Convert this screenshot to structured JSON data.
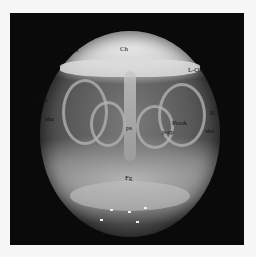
{
  "figure": {
    "labels": {
      "ch": "Ch",
      "r_on": "R-ON",
      "l_on": "L-ON",
      "ica_left": "ICA",
      "ica_right": "ICA",
      "sha_left": "sha",
      "sha_right": "sha",
      "ps": "ps",
      "pcp": "p-cp",
      "pcom": "PcoA",
      "fg": "Fg"
    },
    "colors": {
      "background": "#f7f7f7",
      "panel": "#0a0a0a",
      "label_text": "#111111"
    }
  }
}
